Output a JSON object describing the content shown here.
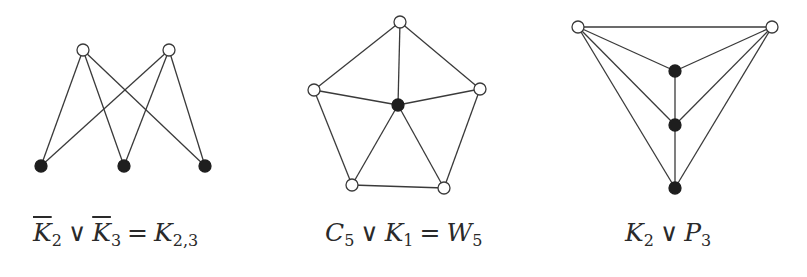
{
  "figure": {
    "graphs": [
      {
        "id": "k23",
        "caption": {
          "parts": [
            "K",
            "2",
            "∨",
            "K",
            "3",
            "=",
            "K",
            "2,3"
          ],
          "text": "K̄2 ∨ K̄3 = K2,3"
        },
        "nodes": [
          {
            "x": 83,
            "y": 50,
            "color": "white"
          },
          {
            "x": 169,
            "y": 50,
            "color": "white"
          },
          {
            "x": 41,
            "y": 166,
            "color": "black"
          },
          {
            "x": 124,
            "y": 166,
            "color": "black"
          },
          {
            "x": 205,
            "y": 166,
            "color": "black"
          }
        ],
        "edges": [
          [
            0,
            2
          ],
          [
            0,
            3
          ],
          [
            0,
            4
          ],
          [
            1,
            2
          ],
          [
            1,
            3
          ],
          [
            1,
            4
          ]
        ]
      },
      {
        "id": "w5",
        "caption": {
          "parts": [
            "C",
            "5",
            "∨",
            "K",
            "1",
            "=",
            "W",
            "5"
          ],
          "text": "C5 ∨ K1 = W5"
        },
        "nodes": [
          {
            "x": 400,
            "y": 22,
            "color": "white"
          },
          {
            "x": 480,
            "y": 89,
            "color": "white"
          },
          {
            "x": 444,
            "y": 188,
            "color": "white"
          },
          {
            "x": 352,
            "y": 185,
            "color": "white"
          },
          {
            "x": 314,
            "y": 90,
            "color": "white"
          },
          {
            "x": 398,
            "y": 105,
            "color": "black"
          }
        ],
        "edges": [
          [
            0,
            1
          ],
          [
            1,
            2
          ],
          [
            2,
            3
          ],
          [
            3,
            4
          ],
          [
            4,
            0
          ],
          [
            5,
            0
          ],
          [
            5,
            1
          ],
          [
            5,
            2
          ],
          [
            5,
            3
          ],
          [
            5,
            4
          ]
        ]
      },
      {
        "id": "k2p3",
        "caption": {
          "parts": [
            "K",
            "2",
            "∨",
            "P",
            "3"
          ],
          "text": "K2 ∨ P3"
        },
        "nodes": [
          {
            "x": 578,
            "y": 27,
            "color": "white"
          },
          {
            "x": 772,
            "y": 27,
            "color": "white"
          },
          {
            "x": 675,
            "y": 71,
            "color": "black"
          },
          {
            "x": 675,
            "y": 125,
            "color": "black"
          },
          {
            "x": 675,
            "y": 188,
            "color": "black"
          }
        ],
        "edges": [
          [
            0,
            1
          ],
          [
            0,
            2
          ],
          [
            0,
            3
          ],
          [
            0,
            4
          ],
          [
            1,
            2
          ],
          [
            1,
            3
          ],
          [
            1,
            4
          ],
          [
            2,
            3
          ],
          [
            3,
            4
          ]
        ]
      }
    ],
    "node_radius": 6,
    "colors": {
      "edge": "#3a3a3a",
      "black_node": "#1e1e1e",
      "white_node": "#ffffff"
    }
  }
}
